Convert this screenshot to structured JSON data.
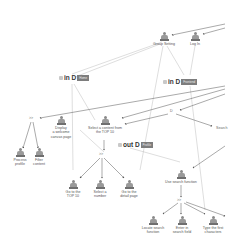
{
  "diagram": {
    "states": [
      {
        "id": "s1",
        "title": "in D",
        "tag": "Home",
        "x": 59,
        "y": 74
      },
      {
        "id": "s2",
        "title": "in D",
        "tag": "Frontend",
        "x": 163,
        "y": 78
      },
      {
        "id": "s3",
        "title": "out D",
        "tag": "Profile",
        "x": 118,
        "y": 141
      }
    ],
    "operators": [
      {
        "id": "o1",
        "label": ">>",
        "x": 31,
        "y": 119
      },
      {
        "id": "o2",
        "label": "D",
        "x": 171,
        "y": 112
      },
      {
        "id": "o3",
        "label": ">>",
        "x": 101,
        "y": 154
      },
      {
        "id": "o4",
        "label": ">>",
        "x": 179,
        "y": 200
      }
    ],
    "tasks": [
      {
        "id": "t1",
        "label": "Group Setting",
        "x": 163,
        "y": 33
      },
      {
        "id": "t2",
        "label": "Log In",
        "x": 195,
        "y": 33
      },
      {
        "id": "t3",
        "label": "Display\na welcome\ncanvas page",
        "x": 61,
        "y": 122
      },
      {
        "id": "t4",
        "label": "Select a content from\nthe TOP 10",
        "x": 104,
        "y": 122
      },
      {
        "id": "t5",
        "label": "Process\nprofile",
        "x": 20,
        "y": 152
      },
      {
        "id": "t6",
        "label": "Filter\ncontent",
        "x": 38,
        "y": 152
      },
      {
        "id": "t7",
        "label": "Go to the\nTOP 10",
        "x": 72,
        "y": 181
      },
      {
        "id": "t8",
        "label": "Select a\nnumber",
        "x": 99,
        "y": 181
      },
      {
        "id": "t9",
        "label": "Go to the\ndetail page",
        "x": 128,
        "y": 181
      },
      {
        "id": "t10",
        "label": "Use search function",
        "x": 180,
        "y": 171
      },
      {
        "id": "t11",
        "label": "Locate search\nfunction",
        "x": 152,
        "y": 223
      },
      {
        "id": "t12",
        "label": "Enter in\nsearch field",
        "x": 182,
        "y": 223
      },
      {
        "id": "t13",
        "label": "Type the first\ncharacters",
        "x": 212,
        "y": 223
      }
    ],
    "edge_fragments": [
      {
        "label": "Search",
        "x": 218,
        "y": 128
      }
    ]
  }
}
